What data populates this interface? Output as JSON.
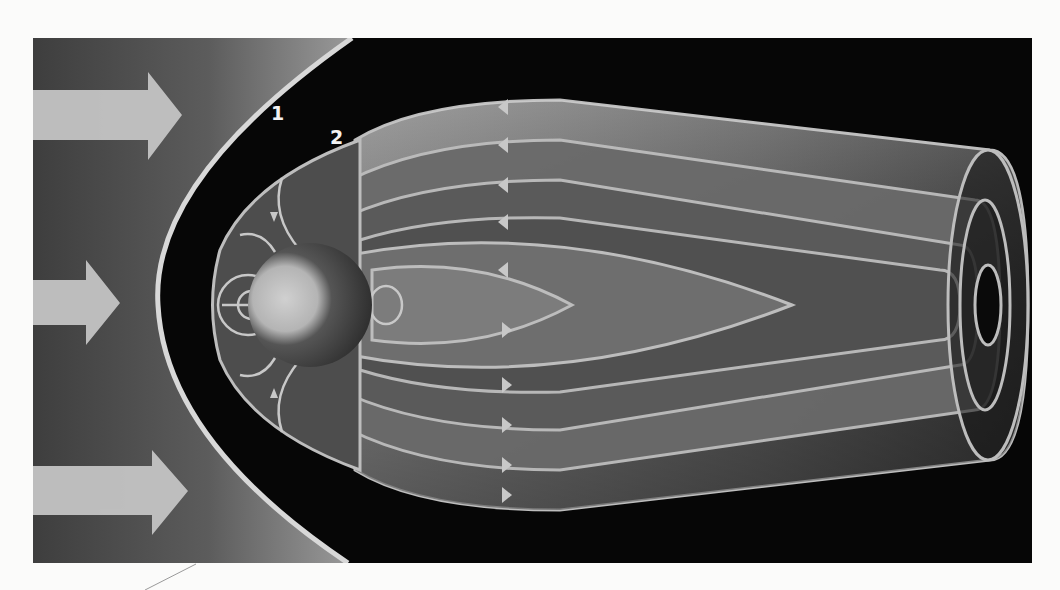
{
  "diagram": {
    "labels": [
      {
        "id": "1",
        "text": "1",
        "target": "bow-shock",
        "x": 271,
        "y": 104
      },
      {
        "id": "2",
        "text": "2",
        "target": "magnetopause",
        "x": 330,
        "y": 128
      }
    ],
    "solar_wind_arrows": [
      {
        "shaft_y": [
          90,
          140
        ],
        "head_x": 148,
        "tip_x": 182,
        "head_y": [
          72,
          160
        ]
      },
      {
        "shaft_y": [
          280,
          325
        ],
        "head_x": 86,
        "tip_x": 120,
        "head_y": [
          260,
          345
        ]
      },
      {
        "shaft_y": [
          466,
          515
        ],
        "head_x": 152,
        "tip_x": 188,
        "head_y": [
          450,
          535
        ]
      }
    ],
    "planet": {
      "cx": 310,
      "cy": 305,
      "r": 62
    },
    "colors": {
      "page": "#fbfbfa",
      "space": "#060606",
      "solar_wind_dark": "#4a4a4a",
      "solar_wind_light": "#9a9a9a",
      "arrow": "#c4c4c4",
      "field_line": "#bdbdbd",
      "shell": "#7a7a7a",
      "label": "#f2f2f2"
    }
  }
}
